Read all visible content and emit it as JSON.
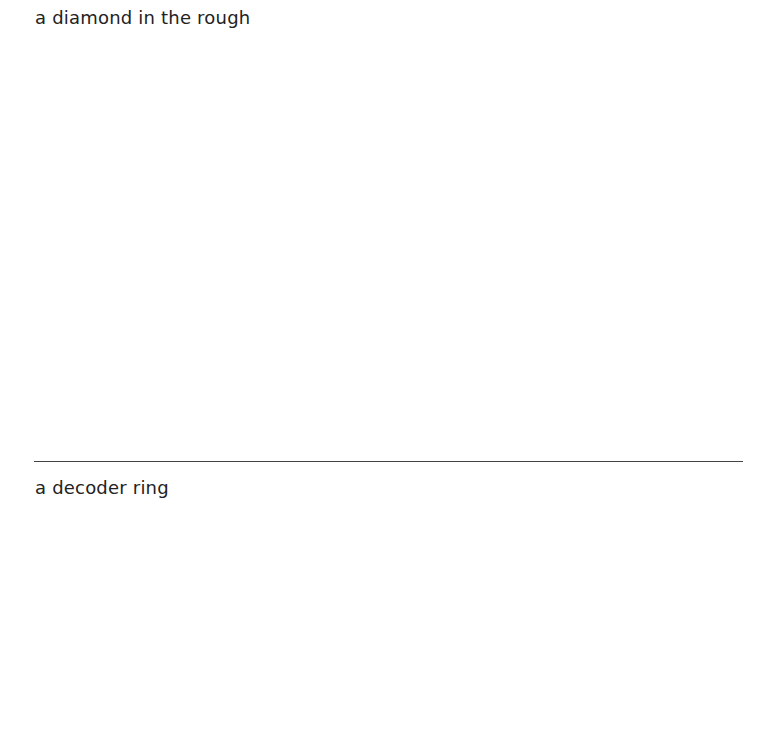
{
  "sections": [
    {
      "label": "a diamond in the rough"
    },
    {
      "label": "a decoder ring"
    }
  ],
  "colors": {
    "text": "#222222",
    "rule": "#444444",
    "background": "#ffffff"
  }
}
